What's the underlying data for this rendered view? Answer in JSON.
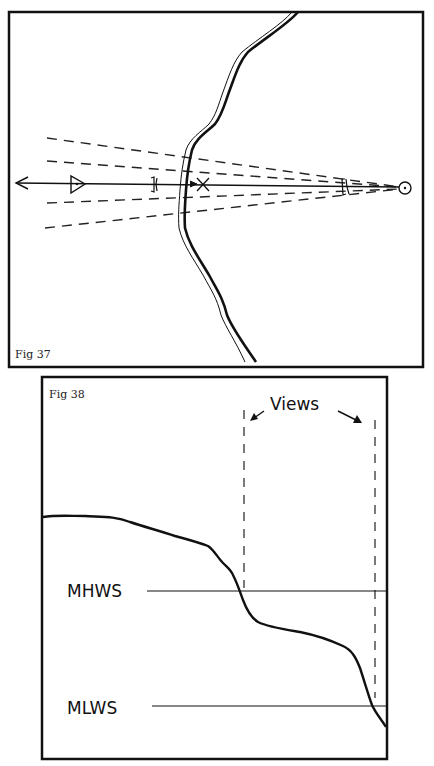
{
  "figures": [
    {
      "id": "fig37",
      "label": "Fig 37",
      "description": "Plan view: transit line of sight crossing a coastline, with dashed view-limit lines converging on a circled point"
    },
    {
      "id": "fig38",
      "label": "Fig 38",
      "annotation": "Views",
      "levels": {
        "high": "MHWS",
        "low": "MLWS"
      },
      "description": "Profile of a shore slope with tide levels and two vertical dashed view lines"
    }
  ],
  "colors": {
    "ink": "#111111",
    "paper": "#ffffff"
  }
}
